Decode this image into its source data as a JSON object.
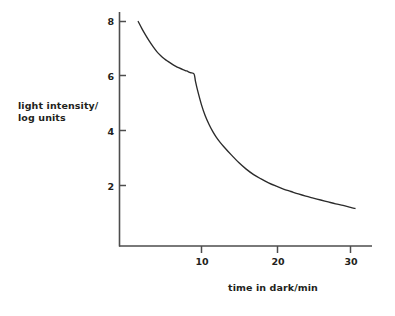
{
  "chart_data": {
    "type": "line",
    "title": "",
    "subtitle": "",
    "xlabel": "time in dark/min",
    "ylabel": "light intensity/\nlog units",
    "xlim": [
      0,
      32
    ],
    "ylim": [
      0,
      8.6
    ],
    "xticks": [
      10,
      20,
      30
    ],
    "xtick_labels": [
      "10",
      "20",
      "30"
    ],
    "yticks": [
      2,
      4,
      6,
      8
    ],
    "ytick_labels": [
      "2",
      "4",
      "6",
      "8"
    ],
    "grid": false,
    "legend": null,
    "annotations": [],
    "line_color": "#2b2b2b",
    "axis_color": "#4d4d4d",
    "series": [
      {
        "name": "dark adaptation curve",
        "note": "Two-limb dark adaptation curve with a cone-rod break (Kohlrausch kink) at about 9 min, 6.05 log units",
        "x": [
          1.5,
          2.0,
          2.5,
          3.0,
          3.5,
          4.0,
          4.5,
          5.0,
          5.5,
          6.0,
          6.5,
          7.0,
          7.5,
          8.0,
          8.5,
          9.0,
          9.2,
          9.5,
          10.0,
          10.5,
          11.0,
          11.5,
          12.0,
          12.5,
          13.0,
          14.0,
          15.0,
          16.0,
          17.0,
          18.0,
          19.0,
          20.0,
          21.0,
          22.0,
          23.0,
          24.0,
          25.0,
          26.0,
          27.0,
          28.0,
          29.0,
          30.0,
          30.6
        ],
        "y": [
          8.0,
          7.74,
          7.5,
          7.28,
          7.08,
          6.9,
          6.76,
          6.64,
          6.54,
          6.45,
          6.37,
          6.3,
          6.24,
          6.19,
          6.13,
          6.08,
          5.8,
          5.45,
          4.95,
          4.55,
          4.24,
          3.98,
          3.76,
          3.58,
          3.42,
          3.12,
          2.84,
          2.6,
          2.4,
          2.24,
          2.1,
          1.98,
          1.87,
          1.78,
          1.69,
          1.61,
          1.54,
          1.47,
          1.4,
          1.33,
          1.27,
          1.2,
          1.16
        ]
      }
    ]
  },
  "axes": {
    "y_title": "light intensity/\nlog units",
    "x_title": "time in dark/min"
  },
  "ticks": {
    "y": [
      "8",
      "6",
      "4",
      "2"
    ],
    "x": [
      "10",
      "20",
      "30"
    ]
  }
}
